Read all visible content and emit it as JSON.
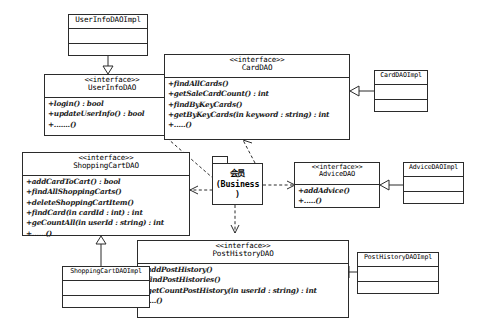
{
  "diagram": {
    "type": "uml-class-diagram",
    "title": "",
    "stereotype_interface": "<<interface>>",
    "ellipsis_op": "+.......()",
    "classes": [
      {
        "id": "UserInfoDAOImpl",
        "name": "UserInfoDAOImpl",
        "kind": "class",
        "stereotype": "",
        "operations": []
      },
      {
        "id": "UserInfoDAO",
        "name": "UserInfoDAO",
        "kind": "interface",
        "stereotype": "<<interface>>",
        "operations": [
          "+login() : bool",
          "+updateUserInfo() : bool",
          "+.......()"
        ]
      },
      {
        "id": "CardDAO",
        "name": "CardDAO",
        "kind": "interface",
        "stereotype": "<<interface>>",
        "operations": [
          "+findAllCards()",
          "+getSaleCardCount() : int",
          "+findByKeyCards()",
          "+getByKeyCards(in keyword : string) : int",
          "+.....()"
        ]
      },
      {
        "id": "CardDAOImpl",
        "name": "CardDAOImpl",
        "kind": "class",
        "stereotype": "",
        "operations": []
      },
      {
        "id": "ShoppingCartDAO",
        "name": "ShoppingCartDAO",
        "kind": "interface",
        "stereotype": "<<interface>>",
        "operations": [
          "+addCardToCart() : bool",
          "+findAllShoppingCarts()",
          "+deleteShoppingCartItem()",
          "+findCard(in cardId : int) : int",
          "+geCountAll(in userId : string) : int",
          "+......()"
        ]
      },
      {
        "id": "ShoppingCartDAOImpl",
        "name": "ShoppingCartDAOImpl",
        "kind": "class",
        "stereotype": "",
        "operations": []
      },
      {
        "id": "AdviceDAO",
        "name": "AdviceDAO",
        "kind": "interface",
        "stereotype": "<<interface>>",
        "operations": [
          "+addAdvice()",
          "+.....()"
        ]
      },
      {
        "id": "AdviceDAOImpl",
        "name": "AdviceDAOImpl",
        "kind": "class",
        "stereotype": "",
        "operations": []
      },
      {
        "id": "PostHistoryDAO",
        "name": "PostHistoryDAO",
        "kind": "interface",
        "stereotype": "<<interface>>",
        "operations": [
          "+addPostHistory()",
          "+findPostHistories()",
          "+getCountPostHistory(in userId : string) : int",
          "+....()"
        ]
      },
      {
        "id": "PostHistoryDAOImpl",
        "name": "PostHistoryDAOImpl",
        "kind": "class",
        "stereotype": "",
        "operations": []
      }
    ],
    "package": {
      "id": "Business",
      "line1": "会员",
      "line2": "(Business",
      "line3": ")"
    },
    "relations": [
      {
        "from": "UserInfoDAOImpl",
        "to": "UserInfoDAO",
        "type": "realization"
      },
      {
        "from": "CardDAOImpl",
        "to": "CardDAO",
        "type": "realization"
      },
      {
        "from": "AdviceDAOImpl",
        "to": "AdviceDAO",
        "type": "realization"
      },
      {
        "from": "ShoppingCartDAOImpl",
        "to": "ShoppingCartDAO",
        "type": "realization"
      },
      {
        "from": "PostHistoryDAOImpl",
        "to": "PostHistoryDAO",
        "type": "realization"
      },
      {
        "from": "Business",
        "to": "CardDAO",
        "type": "dependency"
      },
      {
        "from": "Business",
        "to": "AdviceDAO",
        "type": "dependency"
      },
      {
        "from": "Business",
        "to": "PostHistoryDAO",
        "type": "dependency"
      },
      {
        "from": "Business",
        "to": "ShoppingCartDAO",
        "type": "dependency"
      },
      {
        "from": "Business",
        "to": "UserInfoDAO",
        "type": "dependency"
      }
    ],
    "colors": {
      "stroke": "#2b2b2b",
      "background": "#ffffff",
      "text": "#1b1b1b"
    }
  }
}
